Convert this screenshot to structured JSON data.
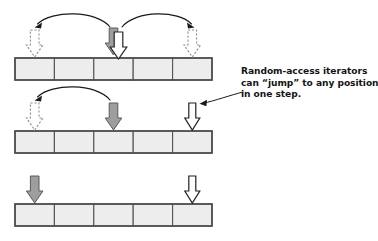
{
  "figure": {
    "background_color": "#ffffff"
  },
  "caption": {
    "name": "annotation-callout",
    "lines": [
      "Random-access iterators",
      "can “jump” to any position",
      "in one step."
    ],
    "full_text": "Random-access iterators can “jump” to any position in one step.",
    "text_color": "#151515",
    "font_weight": "bold"
  },
  "colors": {
    "cell_fill": "#ededed",
    "cell_border": "#555555",
    "frame_border": "#4a4a4a",
    "arrow_solid_fill": "#9e9e9e",
    "arrow_solid_stroke": "#5a5a5a",
    "arrow_hollow_fill": "#ffffff",
    "arrow_hollow_stroke": "#222222",
    "arrow_dashed_stroke": "#8d8d8d",
    "arc_stroke": "#1a1a1a"
  },
  "geometry": {
    "container_x": 15,
    "container_width": 197,
    "cell_count": 5,
    "cell_width": 39.4,
    "row_tops": [
      58,
      131,
      204
    ],
    "row_height": 22
  },
  "rows": [
    {
      "id": "row-1",
      "name": "sequence-row-1",
      "cells": [
        {
          "index": 0,
          "label": ""
        },
        {
          "index": 1,
          "label": ""
        },
        {
          "index": 2,
          "label": ""
        },
        {
          "index": 3,
          "label": ""
        },
        {
          "index": 4,
          "label": ""
        }
      ],
      "markers": [
        {
          "name": "ghost-iterator-left",
          "cell": 0,
          "style": "dashed",
          "x": 34.7
        },
        {
          "name": "current-iterator",
          "cell": 2,
          "style": "solid",
          "x": 113.5
        },
        {
          "name": "current-iterator-alt",
          "cell": 2,
          "style": "hollow",
          "x": 118.5
        },
        {
          "name": "ghost-iterator-right",
          "cell": 4,
          "style": "dashed",
          "x": 192.3
        }
      ],
      "arcs": [
        {
          "name": "jump-arc-left",
          "from_x": 110,
          "to_x": 36,
          "direction": "left"
        },
        {
          "name": "jump-arc-right",
          "from_x": 122,
          "to_x": 191,
          "direction": "right"
        }
      ]
    },
    {
      "id": "row-2",
      "name": "sequence-row-2",
      "cells": [
        {
          "index": 0,
          "label": ""
        },
        {
          "index": 1,
          "label": ""
        },
        {
          "index": 2,
          "label": ""
        },
        {
          "index": 3,
          "label": ""
        },
        {
          "index": 4,
          "label": ""
        }
      ],
      "markers": [
        {
          "name": "ghost-iterator-left",
          "cell": 0,
          "style": "dashed",
          "x": 34.7
        },
        {
          "name": "current-iterator",
          "cell": 2,
          "style": "solid",
          "x": 113.5
        },
        {
          "name": "end-iterator",
          "cell": 4,
          "style": "hollow",
          "x": 192.3
        }
      ],
      "arcs": [
        {
          "name": "jump-arc-left",
          "from_x": 110,
          "to_x": 36,
          "direction": "left"
        }
      ]
    },
    {
      "id": "row-3",
      "name": "sequence-row-3",
      "cells": [
        {
          "index": 0,
          "label": ""
        },
        {
          "index": 1,
          "label": ""
        },
        {
          "index": 2,
          "label": ""
        },
        {
          "index": 3,
          "label": ""
        },
        {
          "index": 4,
          "label": ""
        }
      ],
      "markers": [
        {
          "name": "current-iterator",
          "cell": 0,
          "style": "solid",
          "x": 34.7
        },
        {
          "name": "end-iterator",
          "cell": 4,
          "style": "hollow",
          "x": 192.3
        }
      ],
      "arcs": []
    }
  ],
  "leader": {
    "name": "callout-leader-line",
    "tip_x": 200,
    "tip_y": 103,
    "anchor_x": 243,
    "anchor_y": 92
  }
}
